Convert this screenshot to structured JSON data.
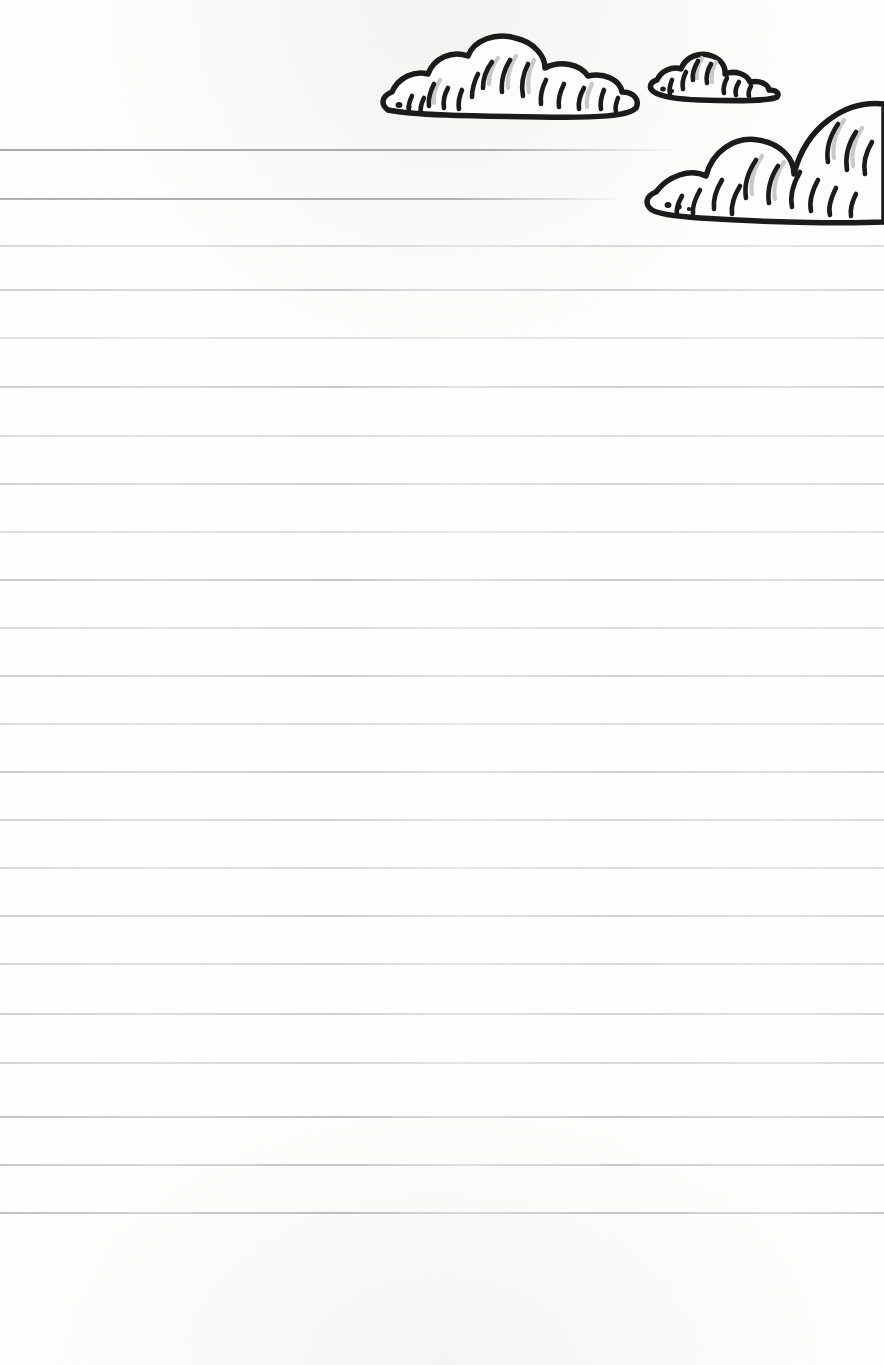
{
  "page": {
    "kind": "ruled-stationery-sheet",
    "width": 884,
    "height": 1365,
    "background_color": "#ffffff",
    "rule_color": "#a9abb1",
    "ink_color": "#1b1b1b",
    "cloud_fill_color": "#fdfdfd",
    "cloud_shadow_color": "#c9c9c9"
  },
  "writing_area": {
    "label": "ruled writing lines",
    "line_count": 22,
    "line_spacing_px": 48,
    "first_line_y": 150,
    "last_line_y": 1213,
    "left_margin_x": 0,
    "bottom_blank_space_px": 152,
    "lines": [
      {
        "index": 1,
        "y": 150,
        "x_start": 0,
        "x_end": 680,
        "opacity": 0.85,
        "note": "shortened to clear cloud artwork"
      },
      {
        "index": 2,
        "y": 199,
        "x_start": 0,
        "x_end": 624,
        "opacity": 0.8,
        "note": "shortened to clear cloud artwork"
      },
      {
        "index": 3,
        "y": 246,
        "x_start": 0,
        "x_end": 884,
        "opacity": 0.62,
        "note": ""
      },
      {
        "index": 4,
        "y": 290,
        "x_start": 0,
        "x_end": 884,
        "opacity": 0.7,
        "note": "faint break near x=440"
      },
      {
        "index": 5,
        "y": 338,
        "x_start": 0,
        "x_end": 884,
        "opacity": 0.55,
        "note": ""
      },
      {
        "index": 6,
        "y": 387,
        "x_start": 0,
        "x_end": 884,
        "opacity": 0.72,
        "note": ""
      },
      {
        "index": 7,
        "y": 436,
        "x_start": 0,
        "x_end": 884,
        "opacity": 0.6,
        "note": ""
      },
      {
        "index": 8,
        "y": 484,
        "x_start": 0,
        "x_end": 884,
        "opacity": 0.68,
        "note": ""
      },
      {
        "index": 9,
        "y": 532,
        "x_start": 0,
        "x_end": 884,
        "opacity": 0.58,
        "note": ""
      },
      {
        "index": 10,
        "y": 580,
        "x_start": 0,
        "x_end": 884,
        "opacity": 0.74,
        "note": ""
      },
      {
        "index": 11,
        "y": 628,
        "x_start": 0,
        "x_end": 884,
        "opacity": 0.62,
        "note": ""
      },
      {
        "index": 12,
        "y": 676,
        "x_start": 0,
        "x_end": 884,
        "opacity": 0.7,
        "note": ""
      },
      {
        "index": 13,
        "y": 724,
        "x_start": 0,
        "x_end": 884,
        "opacity": 0.6,
        "note": ""
      },
      {
        "index": 14,
        "y": 772,
        "x_start": 0,
        "x_end": 884,
        "opacity": 0.72,
        "note": ""
      },
      {
        "index": 15,
        "y": 820,
        "x_start": 0,
        "x_end": 884,
        "opacity": 0.66,
        "note": ""
      },
      {
        "index": 16,
        "y": 868,
        "x_start": 0,
        "x_end": 884,
        "opacity": 0.62,
        "note": ""
      },
      {
        "index": 17,
        "y": 916,
        "x_start": 0,
        "x_end": 884,
        "opacity": 0.7,
        "note": ""
      },
      {
        "index": 18,
        "y": 964,
        "x_start": 0,
        "x_end": 884,
        "opacity": 0.64,
        "note": ""
      },
      {
        "index": 19,
        "y": 1014,
        "x_start": 0,
        "x_end": 884,
        "opacity": 0.68,
        "note": ""
      },
      {
        "index": 20,
        "y": 1063,
        "x_start": 0,
        "x_end": 884,
        "opacity": 0.66,
        "note": ""
      },
      {
        "index": 21,
        "y": 1117,
        "x_start": 0,
        "x_end": 884,
        "opacity": 0.78,
        "note": ""
      },
      {
        "index": 22,
        "y": 1165,
        "x_start": 0,
        "x_end": 884,
        "opacity": 0.74,
        "note": ""
      },
      {
        "index": 23,
        "y": 1213,
        "x_start": 0,
        "x_end": 884,
        "opacity": 0.8,
        "note": "final rule, slight wave near x=560"
      }
    ]
  },
  "illustration": {
    "label": "hand-drawn cartoon clouds",
    "style": "black ink outline with curved hatch shading",
    "clouds": [
      {
        "name": "large-left-cloud",
        "x": 378,
        "y": 38,
        "width": 262,
        "height": 82,
        "puff_count": 5
      },
      {
        "name": "small-middle-cloud",
        "x": 648,
        "y": 48,
        "width": 136,
        "height": 48,
        "puff_count": 4
      },
      {
        "name": "large-right-cloud",
        "x": 640,
        "y": 60,
        "width": 244,
        "height": 165,
        "puff_count": 4,
        "clipped_by_page_edge": true
      }
    ]
  }
}
